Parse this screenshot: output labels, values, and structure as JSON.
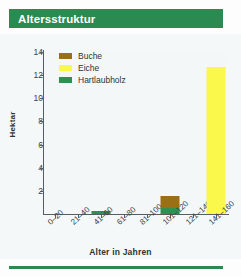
{
  "title": "Altersstruktur",
  "colors": {
    "banner_green": "#2a8a4f",
    "buche_brown": "#9a7016",
    "eiche_yellow": "#faf84a",
    "hartlaubholz_green": "#2e9151",
    "axis": "#555f63",
    "plot_background": "#f4f7f8"
  },
  "legend": {
    "position": "top-left-inside",
    "items": [
      {
        "label": "Buche",
        "color": "#9a7016"
      },
      {
        "label": "Eiche",
        "color": "#faf84a"
      },
      {
        "label": "Hartlaubholz",
        "color": "#2e9151"
      }
    ]
  },
  "chart_data": {
    "type": "bar",
    "title": "Altersstruktur",
    "xlabel": "Alter in Jahren",
    "ylabel": "Hektar",
    "ylim": [
      0,
      14
    ],
    "yticks": [
      2,
      4,
      6,
      8,
      10,
      12,
      14
    ],
    "grid": false,
    "stacked": true,
    "categories": [
      "0–20",
      "21–40",
      "41–60",
      "61–80",
      "81–100",
      "101–120",
      "121–140",
      "141–160"
    ],
    "series": [
      {
        "name": "Buche",
        "color": "#9a7016",
        "values": [
          0,
          0,
          0,
          0,
          0,
          1.1,
          0,
          0
        ]
      },
      {
        "name": "Eiche",
        "color": "#faf84a",
        "values": [
          0,
          0,
          0,
          0,
          0,
          0,
          0,
          12.7
        ]
      },
      {
        "name": "Hartlaubholz",
        "color": "#2e9151",
        "values": [
          0,
          0,
          0.25,
          0,
          0,
          0.5,
          0,
          0
        ]
      }
    ]
  }
}
